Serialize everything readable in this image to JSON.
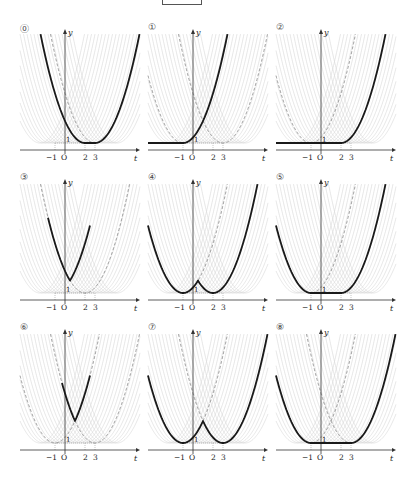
{
  "title_box": "",
  "axis": {
    "x_label": "t",
    "y_label": "y",
    "origin_label": "O",
    "ticks_t": [
      "-1",
      "2",
      "3"
    ],
    "tick_y": "1"
  },
  "colors": {
    "bold": "#1a1a1a",
    "family": "#d6d6d6",
    "dashed": "#777777",
    "axis": "#333333"
  },
  "panels": [
    {
      "label": "⓪",
      "bold": {
        "type": "min_range",
        "a": 2,
        "b": 3
      },
      "dashed": [
        3
      ]
    },
    {
      "label": "①",
      "bold": {
        "type": "left_flat",
        "a": -1
      },
      "dashed": [
        -1,
        3
      ]
    },
    {
      "label": "②",
      "bold": {
        "type": "left_flat",
        "a": 2
      },
      "dashed": [
        -1
      ]
    },
    {
      "label": "③",
      "bold": {
        "type": "max_two",
        "a": -1,
        "b": 2,
        "from": -1.7,
        "to": 2.5
      },
      "dashed": [
        2
      ]
    },
    {
      "label": "④",
      "bold": {
        "type": "min_two",
        "a": -1,
        "b": 2
      },
      "dashed": [
        -1
      ]
    },
    {
      "label": "⑤",
      "bold": {
        "type": "min_range",
        "a": -1,
        "b": 2
      },
      "dashed": [
        -1
      ]
    },
    {
      "label": "⑥",
      "bold": {
        "type": "max_two",
        "a": -1,
        "b": 3,
        "from": -0.3,
        "to": 2.5
      },
      "dashed": [
        -1,
        3
      ]
    },
    {
      "label": "⑦",
      "bold": {
        "type": "min_two",
        "a": -1,
        "b": 3
      },
      "dashed": [
        -1,
        3
      ]
    },
    {
      "label": "⑧",
      "bold": {
        "type": "min_range",
        "a": -1,
        "b": 3
      },
      "dashed": [
        -1,
        3
      ]
    }
  ]
}
